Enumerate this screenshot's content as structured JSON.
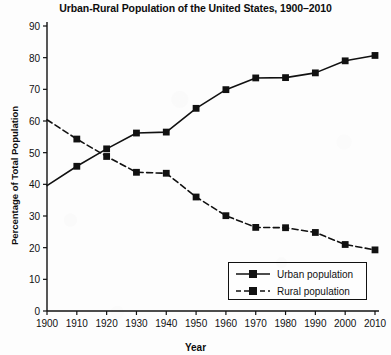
{
  "chart_data": {
    "type": "line",
    "title": "Urban-Rural Population of the United States, 1900–2010",
    "xlabel": "Year",
    "ylabel": "Percentage of Total Population",
    "categories": [
      1900,
      1910,
      1920,
      1930,
      1940,
      1950,
      1960,
      1970,
      1980,
      1990,
      2000,
      2010
    ],
    "xticklabels": [
      "1900",
      "1910",
      "1920",
      "1930",
      "1940",
      "1950",
      "1960",
      "1970",
      "1980",
      "1990",
      "2000",
      "2010"
    ],
    "yticklabels": [
      "0",
      "10",
      "20",
      "30",
      "40",
      "50",
      "60",
      "70",
      "80",
      "90"
    ],
    "yticks": [
      0,
      10,
      20,
      30,
      40,
      50,
      60,
      70,
      80,
      90
    ],
    "xlim": [
      1900,
      2010
    ],
    "ylim": [
      0,
      90
    ],
    "grid": false,
    "legend_position": "lower right",
    "series": [
      {
        "name": "Urban population",
        "linestyle": "solid",
        "marker": "square",
        "color": "#111111",
        "values": [
          39.6,
          45.7,
          51.2,
          56.2,
          56.5,
          64.0,
          69.9,
          73.6,
          73.7,
          75.2,
          79.0,
          80.7
        ]
      },
      {
        "name": "Rural population",
        "linestyle": "dashed",
        "marker": "square",
        "color": "#111111",
        "values": [
          60.4,
          54.3,
          48.8,
          43.8,
          43.5,
          36.0,
          30.1,
          26.4,
          26.3,
          24.8,
          21.0,
          19.3
        ]
      }
    ]
  },
  "legend": {
    "items": [
      {
        "label": "Urban population",
        "style": "solid"
      },
      {
        "label": "Rural population",
        "style": "dashed"
      }
    ]
  },
  "colors": {
    "ink": "#111111",
    "background": "#fdfdfd"
  }
}
